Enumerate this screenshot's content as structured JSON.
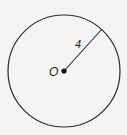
{
  "diagram": {
    "type": "circle",
    "center_label": "O",
    "radius_label": "4",
    "center": [
      64,
      71
    ],
    "radius_px": 56,
    "radius_endpoint": [
      102,
      29
    ],
    "stroke_color": "#2a2a2a",
    "background_color": "#f4f4f2"
  }
}
